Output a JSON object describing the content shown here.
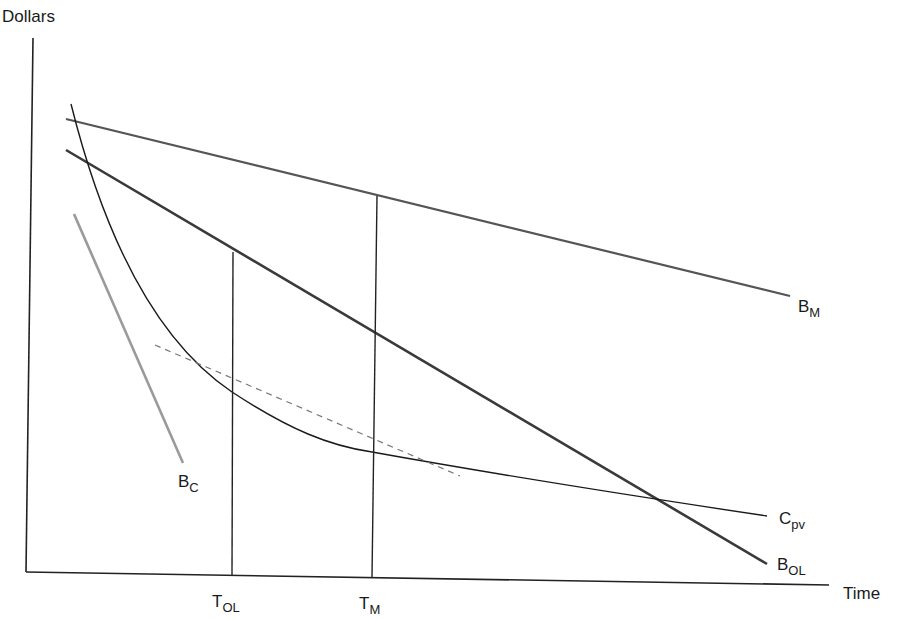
{
  "diagram": {
    "y_axis_label": "Dollars",
    "x_axis_label": "Time",
    "curves": {
      "b_m": {
        "main": "B",
        "sub": "M",
        "color": "#555555"
      },
      "b_ol": {
        "main": "B",
        "sub": "OL",
        "color": "#3a3a3a"
      },
      "c_pv": {
        "main": "C",
        "sub": "pv",
        "color": "#1a1a1a"
      },
      "b_c": {
        "main": "B",
        "sub": "C",
        "color": "#9a9a9a"
      }
    },
    "time_markers": {
      "t_ol": {
        "main": "T",
        "sub": "OL"
      },
      "t_m": {
        "main": "T",
        "sub": "M"
      }
    },
    "tangent_line": {
      "style": "dashed",
      "color": "#777777"
    }
  }
}
